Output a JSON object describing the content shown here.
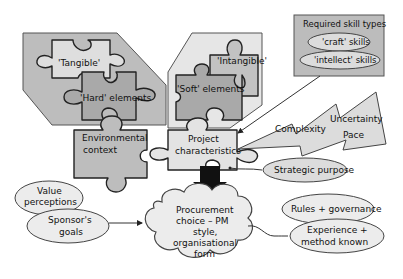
{
  "diagram": {
    "left_cluster": {
      "tangible_label": "'Tangible'",
      "hard_label": "'Hard' elements"
    },
    "right_cluster": {
      "intangible_label": "'Intangible'",
      "soft_label": "'Soft' elements"
    },
    "skills_box": {
      "title": "Required skill types",
      "items": [
        "'craft' skills",
        "'intellect' skills"
      ]
    },
    "environmental_context": {
      "line1": "Environmental",
      "line2": "context"
    },
    "project_characteristics": {
      "line1": "Project",
      "line2": "characteristics"
    },
    "lightning": {
      "labels": [
        "Complexity",
        "Uncertainty",
        "Pace"
      ]
    },
    "strategic_purpose": "Strategic purpose",
    "left_ellipses": {
      "value_line1": "Value",
      "value_line2": "perceptions",
      "sponsor_line1": "Sponsor's",
      "sponsor_line2": "goals"
    },
    "cloud": {
      "lines": [
        "Procurement",
        "choice – PM",
        "style,",
        "organisational",
        "form"
      ]
    },
    "right_ellipses": {
      "rules": "Rules + governance",
      "experience_line1": "Experience +",
      "experience_line2": "method known"
    },
    "colors": {
      "dark_gray": "#a9a9a9",
      "mid_gray": "#c4c4c4",
      "light_gray": "#dcdcdc",
      "very_light": "#ebebeb",
      "outline": "#222222",
      "arrow": "#111111"
    }
  }
}
